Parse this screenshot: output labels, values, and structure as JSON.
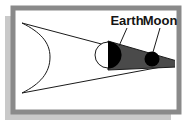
{
  "figure": {
    "name": "lunar-eclipse-diagram",
    "background_color": "#ffffff",
    "frame": {
      "border_color": "#8a8a8a",
      "inner_fill": "#ffffff",
      "drop_shadow_color": "#c9c9c9",
      "x": 13,
      "y": 8,
      "width": 166,
      "height": 104,
      "border_width": 5,
      "shadow_offset_x": -8,
      "shadow_offset_y": 8
    },
    "labels": [
      {
        "id": "earth-label",
        "text": "Earth",
        "x": 127,
        "y": 24,
        "anchor": "middle",
        "leader_line": {
          "x1": 127,
          "y1": 28,
          "x2": 119,
          "y2": 46
        }
      },
      {
        "id": "moon-label",
        "text": "Moon",
        "x": 160,
        "y": 24,
        "anchor": "middle",
        "leader_line": {
          "x1": 160,
          "y1": 28,
          "x2": 153,
          "y2": 52
        }
      }
    ],
    "bodies": [
      {
        "id": "sun-limb",
        "name": "Sun",
        "kind": "arc",
        "description": "Large arc at left representing the Sun's limb",
        "stroke": "#1a1a1a",
        "fill": "none",
        "path": "M 22 23 C 40 32, 50 42, 50 57 C 50 73, 40 84, 22 93"
      },
      {
        "id": "earth-body",
        "name": "Earth",
        "kind": "circle",
        "cx": 108,
        "cy": 55,
        "r": 13,
        "lit_fill": "#ffffff",
        "dark_fill": "#000000",
        "stroke": "#1a1a1a",
        "description": "Earth shown half lit, half in darkness"
      },
      {
        "id": "moon-body",
        "name": "Moon",
        "kind": "circle",
        "cx": 152,
        "cy": 59,
        "r": 7.5,
        "fill": "#000000",
        "description": "Moon inside Earth's umbral shadow"
      }
    ],
    "shadow_cone": {
      "id": "umbra-cone",
      "name": "Earth umbral shadow",
      "fill": "#4a4a4a",
      "stroke": "#1a1a1a",
      "points": "108,42 176,62 176,66 108,69"
    },
    "light_rays": [
      {
        "id": "ray-upper",
        "x1": 22,
        "y1": 23,
        "x2": 177,
        "y2": 64
      },
      {
        "id": "ray-lower",
        "x1": 22,
        "y1": 93,
        "x2": 177,
        "y2": 64
      }
    ]
  }
}
